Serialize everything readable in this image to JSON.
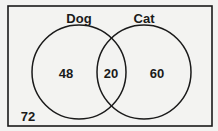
{
  "diagram": {
    "type": "venn",
    "sets": [
      {
        "label": "Dog",
        "only_value": "48"
      },
      {
        "label": "Cat",
        "only_value": "60"
      }
    ],
    "intersection_value": "20",
    "outside_value": "72"
  },
  "colors": {
    "stroke": "#1a1a1a",
    "background": "#f3f3f1"
  }
}
